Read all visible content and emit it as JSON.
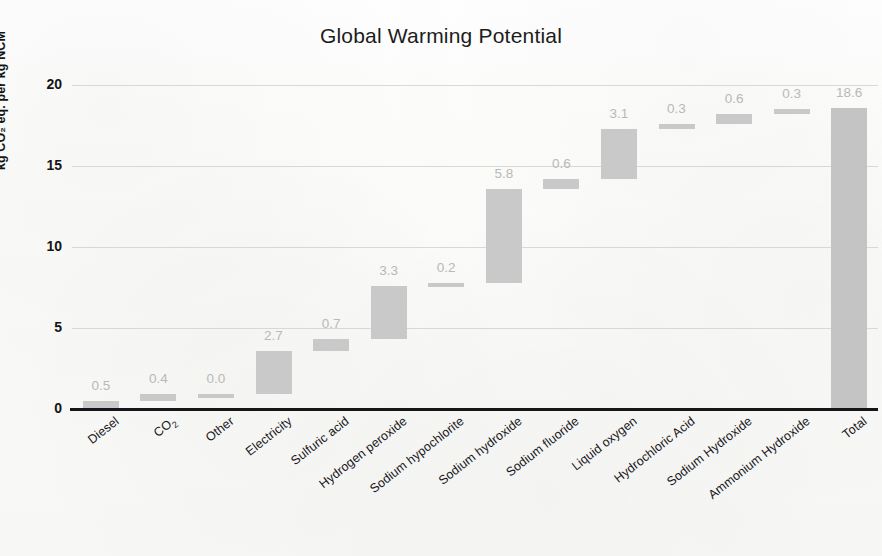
{
  "chart_data": {
    "type": "bar",
    "subtype": "waterfall",
    "title": "Global Warming Potential",
    "xlabel": "",
    "ylabel": "kg CO₂ eq. per kg NCM",
    "ylim": [
      0,
      20
    ],
    "yticks": [
      0,
      5,
      10,
      15,
      20
    ],
    "ytick_labels": [
      "0",
      "5",
      "10",
      "15",
      "20"
    ],
    "grid": true,
    "legend": null,
    "categories": [
      "Diesel",
      "CO₂",
      "Other",
      "Electricity",
      "Sulfuric acid",
      "Hydrogen peroxide",
      "Sodium hypochlorite",
      "Sodium hydroxide",
      "Sodium fluoride",
      "Liquid oxygen",
      "Hydrochloric Acid",
      "Sodium Hydroxide",
      "Ammonium Hydroxide",
      "Total"
    ],
    "values": [
      0.5,
      0.4,
      0.0,
      2.7,
      0.7,
      3.3,
      0.2,
      5.8,
      0.6,
      3.1,
      0.3,
      0.6,
      0.3,
      18.6
    ],
    "data_labels": [
      "0.5",
      "0.4",
      "0.0",
      "2.7",
      "0.7",
      "3.3",
      "0.2",
      "5.8",
      "0.6",
      "3.1",
      "0.3",
      "0.6",
      "0.3",
      "18.6"
    ],
    "bar_bases": [
      0.0,
      0.5,
      0.9,
      0.9,
      3.6,
      4.3,
      7.6,
      7.8,
      13.6,
      14.2,
      17.3,
      17.6,
      18.2,
      0.0
    ],
    "bar_tops": [
      0.5,
      0.9,
      0.9,
      3.6,
      4.3,
      7.6,
      7.8,
      13.6,
      14.2,
      17.3,
      17.6,
      18.2,
      18.5,
      18.6
    ],
    "is_total": [
      false,
      false,
      false,
      false,
      false,
      false,
      false,
      false,
      false,
      false,
      false,
      false,
      false,
      true
    ],
    "bar_color": "#c9c9c9",
    "total_bar_color": "#c4c4c4",
    "label_color": "#b9b9b5",
    "axis_color": "#15151a",
    "grid_color": "#d8d8d4",
    "background_color": "#fbfbfa"
  },
  "chart": {
    "title": "Global Warming Potential",
    "y_axis_title": "kg CO₂ eq. per kg NCM"
  }
}
